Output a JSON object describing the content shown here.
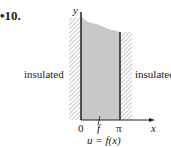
{
  "problem_number": "•10.",
  "labels": {
    "left": "insulated",
    "right": "insulatec",
    "y_axis": "y",
    "x_axis": "x",
    "origin": "0",
    "pi": "π",
    "f_mark": "f",
    "equation": "u = f(x)"
  }
}
